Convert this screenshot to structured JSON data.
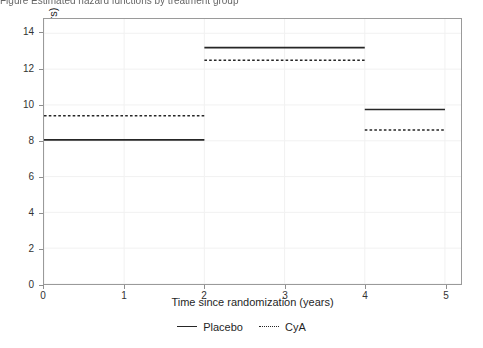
{
  "top_caption": {
    "text_sliver": "Figure  Estimated hazard functions by treatment group"
  },
  "chart_data": {
    "type": "line",
    "title": "",
    "subtitle": "",
    "xlabel": "Time since randomization (years)",
    "ylabel": "Estimated hazard function (per 100 years)",
    "xlim": [
      0,
      5.2
    ],
    "ylim": [
      0,
      14.8
    ],
    "xticks": [
      0,
      1,
      2,
      3,
      4,
      5
    ],
    "xticklabels": [
      "0",
      "1",
      "2",
      "3",
      "4",
      "5"
    ],
    "yticks": [
      0,
      2,
      4,
      6,
      8,
      10,
      12,
      14
    ],
    "yticklabels": [
      "0",
      "2",
      "4",
      "6",
      "8",
      "10",
      "12",
      "14"
    ],
    "grid": true,
    "legend_position": "bottom-center",
    "step_intervals": [
      [
        0,
        2
      ],
      [
        2,
        4
      ],
      [
        4,
        5
      ]
    ],
    "series": [
      {
        "name": "Placebo",
        "linestyle": "solid",
        "color": "#262626",
        "values": [
          8.05,
          13.2,
          9.75
        ]
      },
      {
        "name": "CyA",
        "linestyle": "dotted",
        "color": "#262626",
        "values": [
          9.4,
          12.5,
          8.6
        ]
      }
    ],
    "legend": [
      "Placebo",
      "CyA"
    ],
    "colors": {
      "axis": "#9a9a9a",
      "grid": "#f1f1f1",
      "text": "#1f1f1f",
      "line": "#262626",
      "background": "#ffffff"
    }
  }
}
